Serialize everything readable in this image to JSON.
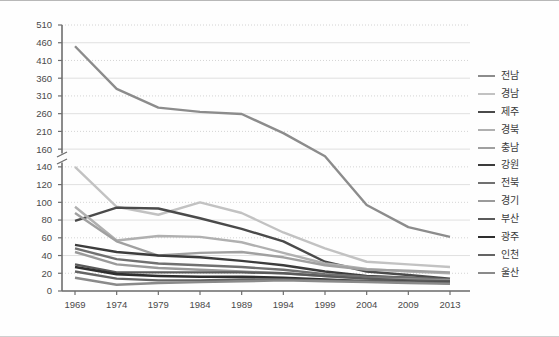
{
  "chart_data": {
    "type": "line",
    "title": "",
    "xlabel": "",
    "ylabel": "",
    "grid": true,
    "legend_position": "right",
    "axis_break": {
      "present": true,
      "between": [
        140,
        160
      ]
    },
    "x": [
      1969,
      1974,
      1979,
      1984,
      1989,
      1994,
      1999,
      2004,
      2009,
      2013
    ],
    "xticklabels": [
      "1969",
      "1974",
      "1979",
      "1984",
      "1989",
      "1994",
      "1999",
      "2004",
      "2009",
      "2013"
    ],
    "yticklabels": [
      "0",
      "20",
      "40",
      "60",
      "80",
      "100",
      "120",
      "140",
      "160",
      "210",
      "260",
      "310",
      "360",
      "410",
      "460",
      "510"
    ],
    "ytickvalues": [
      0,
      20,
      40,
      60,
      80,
      100,
      120,
      140,
      160,
      210,
      260,
      310,
      360,
      410,
      460,
      510
    ],
    "ylim": [
      0,
      510
    ],
    "series": [
      {
        "name": "전남",
        "color": "#8c8c8c",
        "width": 2.4,
        "values": [
          450,
          330,
          277,
          265,
          259,
          205,
          152,
          97,
          72,
          61
        ]
      },
      {
        "name": "경남",
        "color": "#c2c2c2",
        "width": 2.4,
        "values": [
          140,
          95,
          86,
          100,
          88,
          66,
          48,
          33,
          30,
          27
        ]
      },
      {
        "name": "제주",
        "color": "#4a4a4a",
        "width": 2.4,
        "values": [
          79,
          94,
          93,
          82,
          70,
          56,
          33,
          22,
          18,
          14
        ]
      },
      {
        "name": "경북",
        "color": "#b0b0b0",
        "width": 2.4,
        "values": [
          95,
          57,
          62,
          61,
          55,
          43,
          31,
          25,
          22,
          20
        ]
      },
      {
        "name": "충남",
        "color": "#a0a0a0",
        "width": 2.4,
        "values": [
          88,
          56,
          40,
          43,
          44,
          38,
          29,
          24,
          23,
          21
        ]
      },
      {
        "name": "강원",
        "color": "#3c3c3c",
        "width": 2.4,
        "values": [
          52,
          44,
          40,
          38,
          34,
          29,
          22,
          17,
          15,
          13
        ]
      },
      {
        "name": "전북",
        "color": "#707070",
        "width": 2.4,
        "values": [
          48,
          36,
          31,
          29,
          27,
          24,
          19,
          16,
          15,
          13
        ]
      },
      {
        "name": "경기",
        "color": "#9a9a9a",
        "width": 2.4,
        "values": [
          44,
          30,
          26,
          24,
          22,
          20,
          17,
          14,
          13,
          12
        ]
      },
      {
        "name": "부산",
        "color": "#5a5a5a",
        "width": 2.4,
        "values": [
          30,
          21,
          21,
          21,
          21,
          20,
          17,
          14,
          12,
          11
        ]
      },
      {
        "name": "광주",
        "color": "#2e2e2e",
        "width": 2.6,
        "values": [
          27,
          19,
          17,
          16,
          16,
          15,
          13,
          11,
          10,
          9
        ]
      },
      {
        "name": "인천",
        "color": "#646464",
        "width": 2.4,
        "values": [
          22,
          14,
          12,
          12,
          13,
          13,
          12,
          11,
          10,
          9
        ]
      },
      {
        "name": "울산",
        "color": "#8a8a8a",
        "width": 2.4,
        "values": [
          15,
          7,
          9,
          10,
          11,
          12,
          11,
          10,
          9,
          8
        ]
      }
    ]
  },
  "colors": {
    "background": "#fefefe",
    "grid_solid": "#d8d8d8",
    "grid_dotted": "#c9c9c9",
    "axis": "#6e6e6e",
    "tick_label": "#4a4a4a",
    "legend_label": "#3a3a3a"
  }
}
